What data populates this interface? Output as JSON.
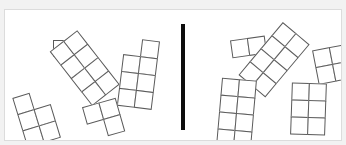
{
  "canvas": {
    "width": 346,
    "height": 145,
    "background": "#ffffff",
    "frame_color": "#dcdcdc",
    "outer_background": "#f2f2f2"
  },
  "divider": {
    "name": "vertical-divider-bar",
    "color": "#0d0d0d",
    "x": 176,
    "y": 14,
    "width": 4,
    "height": 106
  },
  "style": {
    "cell_stroke": "#5a5a5a",
    "cell_fill": "#ffffff",
    "cell_size": 17
  },
  "panels": [
    {
      "id": "left",
      "name": "left-panel",
      "shapes": [
        {
          "id": "L1",
          "name": "monomino-single-square",
          "cells": 1,
          "cols": 1,
          "rows": 1,
          "grid": [
            [
              1
            ]
          ],
          "x": 48,
          "y": 30,
          "cell": 16,
          "rotation": 0
        },
        {
          "id": "L2",
          "name": "octomino-2x4-diagonal",
          "cells": 8,
          "cols": 2,
          "rows": 4,
          "grid": [
            [
              1,
              1
            ],
            [
              1,
              1
            ],
            [
              1,
              1
            ],
            [
              1,
              1
            ]
          ],
          "x": 62,
          "y": 24,
          "cell": 17,
          "rotation": -38
        },
        {
          "id": "L3",
          "name": "heptomino-2x4-missing-topleft",
          "cells": 7,
          "cols": 2,
          "rows": 4,
          "grid": [
            [
              0,
              1
            ],
            [
              1,
              1
            ],
            [
              1,
              1
            ],
            [
              1,
              1
            ]
          ],
          "x": 116,
          "y": 29,
          "cell": 17,
          "rotation": 7
        },
        {
          "id": "L4",
          "name": "pentomino-2x3-missing-topright",
          "cells": 5,
          "cols": 2,
          "rows": 3,
          "grid": [
            [
              1,
              0
            ],
            [
              1,
              1
            ],
            [
              1,
              1
            ]
          ],
          "x": 14,
          "y": 82,
          "cell": 17,
          "rotation": -17
        },
        {
          "id": "L5",
          "name": "tromino-2x2-missing-bottomleft",
          "cells": 3,
          "cols": 2,
          "rows": 2,
          "grid": [
            [
              1,
              1
            ],
            [
              0,
              1
            ]
          ],
          "x": 81,
          "y": 92,
          "cell": 17,
          "rotation": -16
        }
      ]
    },
    {
      "id": "right",
      "name": "right-panel",
      "shapes": [
        {
          "id": "R1",
          "name": "domino-2x1-horizontal",
          "cells": 2,
          "cols": 2,
          "rows": 1,
          "grid": [
            [
              1,
              1
            ]
          ],
          "x": 44,
          "y": 28,
          "cell": 17,
          "rotation": -8
        },
        {
          "id": "R2",
          "name": "octomino-2x4-diagonal",
          "cells": 8,
          "cols": 2,
          "rows": 4,
          "grid": [
            [
              1,
              1
            ],
            [
              1,
              1
            ],
            [
              1,
              1
            ],
            [
              1,
              1
            ]
          ],
          "x": 70,
          "y": 15,
          "cell": 17,
          "rotation": 40
        },
        {
          "id": "R3",
          "name": "tetromino-2x2-square",
          "cells": 4,
          "cols": 2,
          "rows": 2,
          "grid": [
            [
              1,
              1
            ],
            [
              1,
              1
            ]
          ],
          "x": 128,
          "y": 37,
          "cell": 17,
          "rotation": -11
        },
        {
          "id": "R4",
          "name": "octomino-2x4-upright",
          "cells": 8,
          "cols": 2,
          "rows": 4,
          "grid": [
            [
              1,
              1
            ],
            [
              1,
              1
            ],
            [
              1,
              1
            ],
            [
              1,
              1
            ]
          ],
          "x": 32,
          "y": 69,
          "cell": 17,
          "rotation": 5
        },
        {
          "id": "R5",
          "name": "hexomino-2x3-upright",
          "cells": 6,
          "cols": 2,
          "rows": 3,
          "grid": [
            [
              1,
              1
            ],
            [
              1,
              1
            ],
            [
              1,
              1
            ]
          ],
          "x": 104,
          "y": 73,
          "cell": 17,
          "rotation": 2
        }
      ]
    }
  ]
}
